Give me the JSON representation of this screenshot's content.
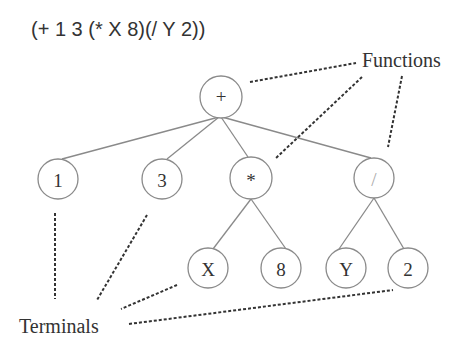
{
  "expression": "(+ 1 3 (* X 8)(/ Y 2))",
  "captions": {
    "functions": "Functions",
    "terminals": "Terminals"
  },
  "tree": {
    "nodes": [
      {
        "id": "plus",
        "label": "+",
        "type": "function",
        "x": 221,
        "y": 97,
        "r": 21
      },
      {
        "id": "one",
        "label": "1",
        "type": "terminal",
        "x": 58,
        "y": 179,
        "r": 20
      },
      {
        "id": "three",
        "label": "3",
        "type": "terminal",
        "x": 162,
        "y": 179,
        "r": 20
      },
      {
        "id": "times",
        "label": "*",
        "type": "function",
        "x": 251,
        "y": 178,
        "r": 21
      },
      {
        "id": "div",
        "label": "/",
        "type": "function",
        "x": 374,
        "y": 178,
        "r": 20
      },
      {
        "id": "x",
        "label": "X",
        "type": "terminal",
        "x": 208,
        "y": 268,
        "r": 20
      },
      {
        "id": "eight",
        "label": "8",
        "type": "terminal",
        "x": 281,
        "y": 268,
        "r": 20
      },
      {
        "id": "y",
        "label": "Y",
        "type": "terminal",
        "x": 346,
        "y": 268,
        "r": 20
      },
      {
        "id": "two",
        "label": "2",
        "type": "terminal",
        "x": 408,
        "y": 268,
        "r": 20
      }
    ],
    "edges": [
      [
        "plus",
        "one"
      ],
      [
        "plus",
        "three"
      ],
      [
        "plus",
        "times"
      ],
      [
        "plus",
        "div"
      ],
      [
        "times",
        "x"
      ],
      [
        "times",
        "eight"
      ],
      [
        "div",
        "y"
      ],
      [
        "div",
        "two"
      ]
    ]
  }
}
